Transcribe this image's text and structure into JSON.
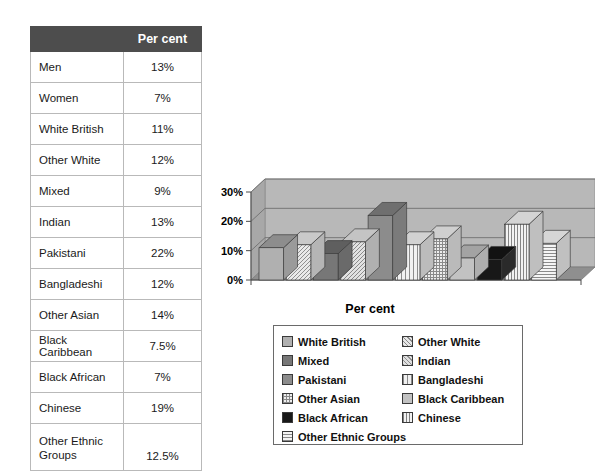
{
  "table": {
    "header": {
      "label_col": "",
      "value_col": "Per cent"
    },
    "rows": [
      {
        "label": "Men",
        "value": "13%"
      },
      {
        "label": "Women",
        "value": "7%"
      },
      {
        "label": "White British",
        "value": "11%"
      },
      {
        "label": "Other White",
        "value": "12%"
      },
      {
        "label": "Mixed",
        "value": "9%"
      },
      {
        "label": "Indian",
        "value": "13%"
      },
      {
        "label": "Pakistani",
        "value": "22%"
      },
      {
        "label": "Bangladeshi",
        "value": "12%"
      },
      {
        "label": "Other Asian",
        "value": "14%"
      },
      {
        "label": "Black Caribbean",
        "value": "7.5%"
      },
      {
        "label": "Black African",
        "value": "7%"
      },
      {
        "label": "Chinese",
        "value": "19%"
      },
      {
        "label": "Other Ethnic\nGroups",
        "value": "12.5%"
      }
    ]
  },
  "chart_data": {
    "type": "bar",
    "title": "",
    "subtitle": "",
    "xlabel": "Per cent",
    "ylabel": "",
    "ylim": [
      0,
      30
    ],
    "yticks": [
      0,
      10,
      20,
      30
    ],
    "ytick_labels": [
      "0%",
      "10%",
      "20%",
      "30%"
    ],
    "grid": true,
    "three_d": true,
    "legend_position": "bottom",
    "categories": [
      "White British",
      "Other White",
      "Mixed",
      "Indian",
      "Pakistani",
      "Bangladeshi",
      "Other Asian",
      "Black Caribbean",
      "Black African",
      "Chinese",
      "Other Ethnic Groups"
    ],
    "values": [
      11,
      12,
      9,
      13,
      22,
      12,
      14,
      7.5,
      7,
      19,
      12.5
    ],
    "series": [
      {
        "name": "Per cent",
        "values": [
          11,
          12,
          9,
          13,
          22,
          12,
          14,
          7.5,
          7,
          19,
          12.5
        ]
      }
    ]
  },
  "chart": {
    "x_axis_title": "Per cent",
    "y_tick_labels": [
      "30%",
      "20%",
      "10%",
      "0%"
    ],
    "wall_color": "#b8b8b8",
    "floor_color": "#8f8f8f",
    "axis_color": "#4a4a4a"
  },
  "legend": {
    "entries": [
      {
        "label": "White British",
        "pattern": "solid-mid",
        "swatch_class": "p-solid-mid"
      },
      {
        "label": "Other White",
        "pattern": "diagonal-a",
        "swatch_class": "p-diag-a"
      },
      {
        "label": "Mixed",
        "pattern": "solid-dark",
        "swatch_class": "p-solid-dark"
      },
      {
        "label": "Indian",
        "pattern": "diagonal-b",
        "swatch_class": "p-diag-b"
      },
      {
        "label": "Pakistani",
        "pattern": "solid-dark2",
        "swatch_class": "p-solid-dark2"
      },
      {
        "label": "Bangladeshi",
        "pattern": "vertical-a",
        "swatch_class": "p-vert-a"
      },
      {
        "label": "Other Asian",
        "pattern": "grid",
        "swatch_class": "p-grid"
      },
      {
        "label": "Black Caribbean",
        "pattern": "solid-light",
        "swatch_class": "p-solid-light"
      },
      {
        "label": "Black African",
        "pattern": "black",
        "swatch_class": "p-black"
      },
      {
        "label": "Chinese",
        "pattern": "vertical-b",
        "swatch_class": "p-vert-b"
      },
      {
        "label": "Other Ethnic Groups",
        "pattern": "horizontal",
        "swatch_class": "p-horz"
      }
    ]
  }
}
